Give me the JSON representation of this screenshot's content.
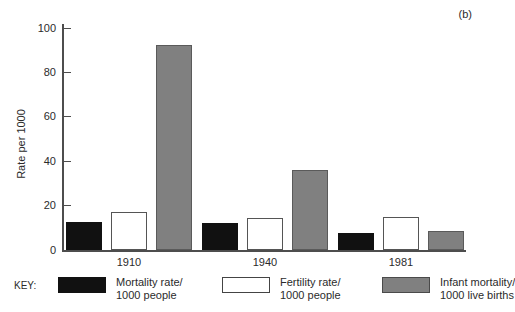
{
  "figure": {
    "panel_label": "(b)"
  },
  "chart_data": {
    "type": "bar",
    "title": "",
    "xlabel": "",
    "ylabel": "Rate per 1000",
    "ylim": [
      0,
      100
    ],
    "yticks": [
      0,
      20,
      40,
      60,
      80,
      100
    ],
    "grid": false,
    "legend_position": "bottom",
    "legend_title": "KEY:",
    "categories": [
      "1910",
      "1940",
      "1981"
    ],
    "series": [
      {
        "name": "Mortality rate/ 1000 people",
        "name_line1": "Mortality rate/",
        "name_line2": "1000 people",
        "fill": "solid-black",
        "color": "#111111",
        "values": [
          12.5,
          12,
          7.5
        ]
      },
      {
        "name": "Fertility rate/ 1000 people",
        "name_line1": "Fertility rate/",
        "name_line2": "1000 people",
        "fill": "open-white",
        "color": "#ffffff",
        "values": [
          17,
          14.5,
          15
        ]
      },
      {
        "name": "Infant mortality/ 1000 live births",
        "name_line1": "Infant mortality/",
        "name_line2": "1000 live births",
        "fill": "solid-gray",
        "color": "#808080",
        "values": [
          92.5,
          36,
          8.5
        ]
      }
    ]
  }
}
